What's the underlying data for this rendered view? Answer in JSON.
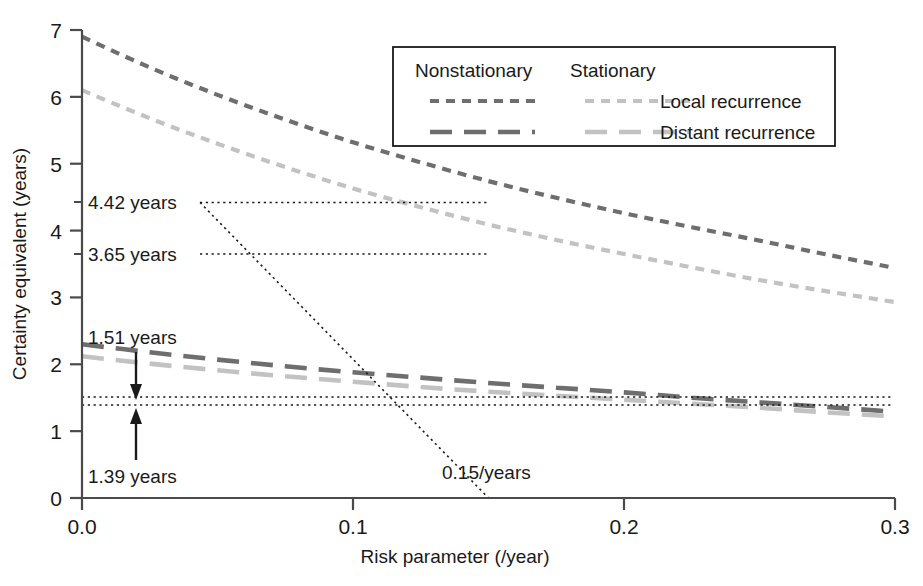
{
  "chart_data": {
    "type": "line",
    "title": "",
    "xlabel": "Risk parameter (/year)",
    "ylabel": "Certainty equivalent (years)",
    "xlim": [
      0.0,
      0.3
    ],
    "ylim": [
      0,
      7
    ],
    "xticks": [
      "0.0",
      "0.1",
      "0.2",
      "0.3"
    ],
    "xtick_values": [
      0.0,
      0.1,
      0.2,
      0.3
    ],
    "yticks": [
      "0",
      "1",
      "2",
      "3",
      "4",
      "5",
      "6",
      "7"
    ],
    "ytick_values": [
      0,
      1,
      2,
      3,
      4,
      5,
      6,
      7
    ],
    "grid": false,
    "legend_position": "top-right",
    "x": [
      0.0,
      0.025,
      0.05,
      0.075,
      0.1,
      0.125,
      0.15,
      0.175,
      0.2,
      0.225,
      0.25,
      0.275,
      0.3
    ],
    "series": [
      {
        "name": "Nonstationary Local recurrence",
        "group": "Nonstationary",
        "measure": "Local recurrence",
        "color": "#6e6e6e",
        "dash": "short",
        "values": [
          6.9,
          6.44,
          6.03,
          5.66,
          5.32,
          5.02,
          4.74,
          4.49,
          4.26,
          4.05,
          3.85,
          3.64,
          3.44
        ]
      },
      {
        "name": "Stationary Local recurrence",
        "group": "Stationary",
        "measure": "Local recurrence",
        "color": "#c2c2c2",
        "dash": "short",
        "values": [
          6.1,
          5.68,
          5.3,
          4.95,
          4.63,
          4.35,
          4.09,
          3.86,
          3.65,
          3.45,
          3.26,
          3.09,
          2.93
        ]
      },
      {
        "name": "Nonstationary Distant recurrence",
        "group": "Nonstationary",
        "measure": "Distant recurrence",
        "color": "#6e6e6e",
        "dash": "long",
        "values": [
          2.3,
          2.18,
          2.07,
          1.97,
          1.88,
          1.8,
          1.72,
          1.65,
          1.58,
          1.5,
          1.43,
          1.36,
          1.29
        ]
      },
      {
        "name": "Stationary Distant recurrence",
        "group": "Stationary",
        "measure": "Distant recurrence",
        "color": "#c2c2c2",
        "dash": "long",
        "values": [
          2.12,
          2.01,
          1.91,
          1.82,
          1.74,
          1.66,
          1.59,
          1.53,
          1.47,
          1.41,
          1.35,
          1.28,
          1.22
        ]
      }
    ],
    "reference_lines": [
      {
        "axis": "x",
        "value": 0.15,
        "label": "0.15/years",
        "style": "dotted"
      },
      {
        "axis": "y",
        "value": 4.42,
        "label": "4.42 years",
        "style": "dotted"
      },
      {
        "axis": "y",
        "value": 3.65,
        "label": "3.65 years",
        "style": "dotted"
      },
      {
        "axis": "y",
        "value": 1.51,
        "label": "1.51 years",
        "style": "dotted"
      },
      {
        "axis": "y",
        "value": 1.39,
        "label": "1.39 years",
        "style": "dotted"
      }
    ],
    "annotations": [
      {
        "text": "4.42 years",
        "x": 0.0,
        "y": 4.42,
        "anchor": "left-of-axis"
      },
      {
        "text": "3.65 years",
        "x": 0.0,
        "y": 3.65,
        "anchor": "left-of-axis"
      },
      {
        "text": "1.51 years",
        "x": 0.02,
        "y": 2.72,
        "arrow": "down-to-1.51"
      },
      {
        "text": "1.39 years",
        "x": 0.02,
        "y": 0.55,
        "arrow": "up-to-1.39"
      },
      {
        "text": "0.15/years",
        "x": 0.15,
        "y": 0.52,
        "arrow": "none"
      }
    ]
  },
  "legend": {
    "col_headers": [
      "Nonstationary",
      "Stationary"
    ],
    "rows": [
      {
        "label": "Local recurrence"
      },
      {
        "label": "Distant recurrence"
      }
    ]
  },
  "axis": {
    "x_title": "Risk parameter (/year)",
    "y_title": "Certainty equivalent (years)",
    "x_tick_labels": [
      "0.0",
      "0.1",
      "0.2",
      "0.3"
    ],
    "y_tick_labels": [
      "0",
      "1",
      "2",
      "3",
      "4",
      "5",
      "6",
      "7"
    ]
  },
  "annotation_labels": {
    "a442": "4.42 years",
    "a365": "3.65 years",
    "a151": "1.51 years",
    "a139": "1.39 years",
    "x015": "0.15/years"
  },
  "colors": {
    "nonstationary": "#6e6e6e",
    "stationary": "#c2c2c2",
    "axis": "#3a3a3a",
    "annotation": "#1a1a1a"
  }
}
